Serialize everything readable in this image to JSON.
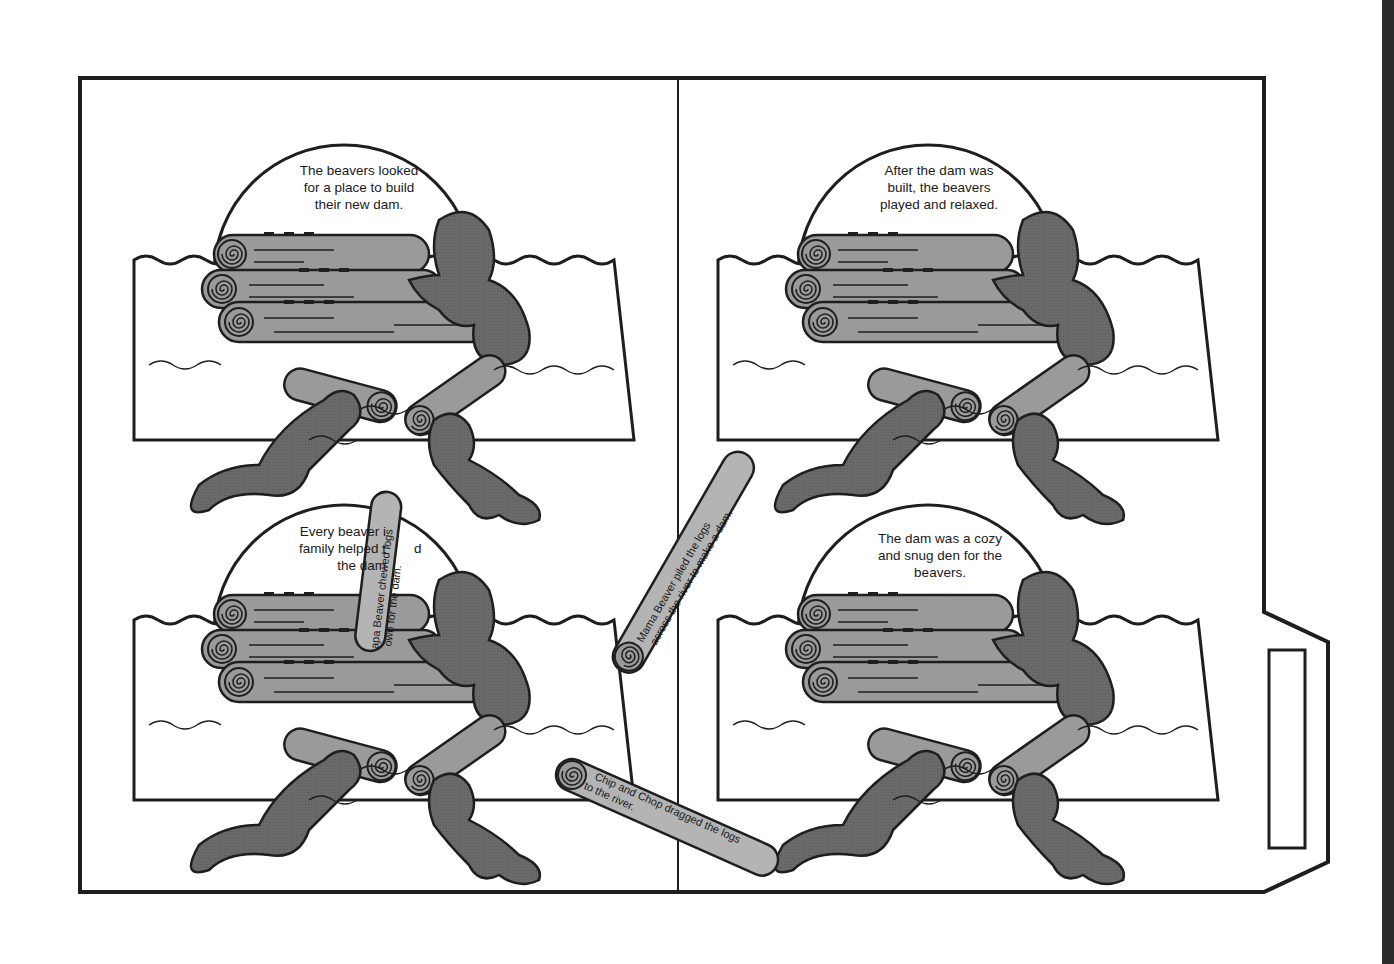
{
  "document": {
    "type": "file-folder sequencing activity",
    "theme": "beavers building a dam",
    "colors": {
      "outline": "#1e1e1e",
      "beaver_fill": "#6a6a6a",
      "log_fill": "#9a9a9a",
      "strip_fill": "#b4b4b4",
      "paper": "#ffffff"
    }
  },
  "panels": [
    {
      "id": "top-left",
      "caption": "The beavers looked for a place to build their new dam.",
      "lines": [
        "The beavers looked",
        "for a place to build",
        "their new dam."
      ]
    },
    {
      "id": "top-right",
      "caption": "After the dam was built, the beavers played and relaxed.",
      "lines": [
        "After the dam was",
        "built, the beavers",
        "played and relaxed."
      ]
    },
    {
      "id": "bottom-left",
      "caption": "Every beaver in the family helped build the dam.",
      "lines": [
        "Every beaver i",
        "family helped t",
        "the dam"
      ],
      "lines_right": [
        "",
        "d",
        ""
      ]
    },
    {
      "id": "bottom-right",
      "caption": "The dam was a cozy and snug den for the beavers.",
      "lines": [
        "The dam was a cozy",
        "and snug den for the",
        "beavers."
      ]
    }
  ],
  "log_strips": [
    {
      "id": "papa",
      "lines": [
        "Papa Beaver chewed logs",
        "down for the dam."
      ],
      "visible_lines": [
        "apa Beaver chewed logs",
        "own for the dam."
      ]
    },
    {
      "id": "mama",
      "lines": [
        "Mama Beaver piled the logs",
        "across the river to make a dam."
      ]
    },
    {
      "id": "chip-chop",
      "lines": [
        "Chip and Chop dragged the logs",
        "to the river."
      ]
    }
  ],
  "folder_tab": {
    "label_box": ""
  }
}
